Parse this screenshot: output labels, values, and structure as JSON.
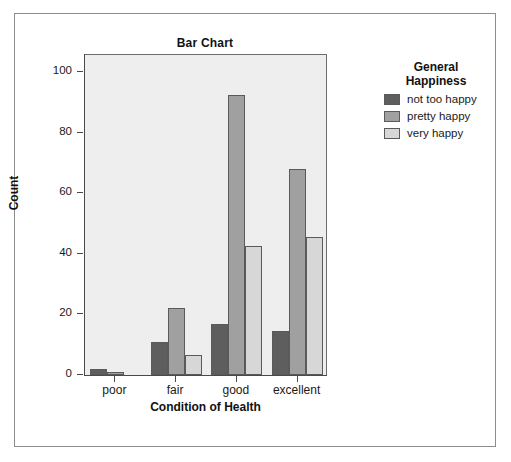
{
  "figure": {
    "title": "Bar Chart",
    "background": "#ffffff",
    "plot_background": "#eeeeee",
    "frame_color": "#8c8c8c"
  },
  "legend": {
    "title_line1": "General",
    "title_line2": "Happiness",
    "entries": [
      {
        "label": "not too happy",
        "color": "#5e5e5e"
      },
      {
        "label": "pretty happy",
        "color": "#a0a0a0"
      },
      {
        "label": "very happy",
        "color": "#d7d7d7"
      }
    ]
  },
  "axes": {
    "y_title": "Count",
    "x_title": "Condition of Health",
    "y_ticks": [
      "0",
      "20",
      "40",
      "60",
      "80",
      "100"
    ],
    "x_ticks": [
      "poor",
      "fair",
      "good",
      "excellent"
    ]
  },
  "chart_data": {
    "type": "bar",
    "title": "Bar Chart",
    "xlabel": "Condition of Health",
    "ylabel": "Count",
    "categories": [
      "poor",
      "fair",
      "good",
      "excellent"
    ],
    "series": [
      {
        "name": "not too happy",
        "color": "#5e5e5e",
        "values": [
          2,
          11,
          17,
          14.5
        ]
      },
      {
        "name": "pretty happy",
        "color": "#a0a0a0",
        "values": [
          1,
          22,
          92.5,
          68
        ]
      },
      {
        "name": "very happy",
        "color": "#d7d7d7",
        "values": [
          0,
          6.5,
          42.5,
          45.5
        ]
      }
    ],
    "ylim": [
      0,
      105
    ],
    "yticks": [
      0,
      20,
      40,
      60,
      80,
      100
    ],
    "grid": false,
    "legend_position": "right",
    "legend_title": "General Happiness"
  }
}
